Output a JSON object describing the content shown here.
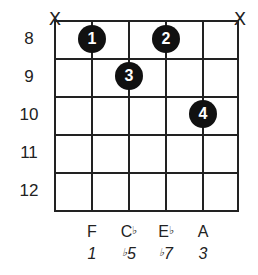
{
  "diagram": {
    "type": "guitar-chord-diagram",
    "strings": 6,
    "frets_shown": [
      8,
      9,
      10,
      11,
      12
    ],
    "muted_strings": [
      1,
      6
    ],
    "mute_symbol": "X",
    "fingers": [
      {
        "finger": "1",
        "string": 2,
        "fret": 8
      },
      {
        "finger": "2",
        "string": 4,
        "fret": 8
      },
      {
        "finger": "3",
        "string": 3,
        "fret": 9
      },
      {
        "finger": "4",
        "string": 5,
        "fret": 10
      }
    ],
    "fret_labels": [
      "8",
      "9",
      "10",
      "11",
      "12"
    ],
    "notes": [
      {
        "string": 2,
        "name": "F",
        "accidental": ""
      },
      {
        "string": 3,
        "name": "C",
        "accidental": "♭"
      },
      {
        "string": 4,
        "name": "E",
        "accidental": "♭"
      },
      {
        "string": 5,
        "name": "A",
        "accidental": ""
      }
    ],
    "intervals": [
      {
        "string": 2,
        "prefix": "",
        "value": "1"
      },
      {
        "string": 3,
        "prefix": "♭",
        "value": "5"
      },
      {
        "string": 4,
        "prefix": "♭",
        "value": "7"
      },
      {
        "string": 5,
        "prefix": "",
        "value": "3"
      }
    ]
  }
}
